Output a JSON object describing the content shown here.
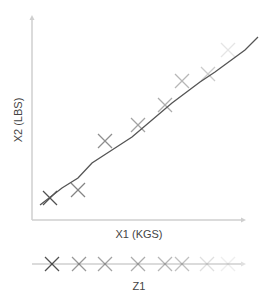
{
  "labels": {
    "y_axis": "X2 (LBS)",
    "x_axis": "X1 (KGS)",
    "z_axis": "Z1"
  },
  "colors": {
    "axis": "#c8c8c8",
    "line": "#555555",
    "label": "#444444"
  },
  "chart_data": {
    "type": "scatter",
    "title": "",
    "xlabel": "X1 (KGS)",
    "ylabel": "X2 (LBS)",
    "grid": false,
    "points": [
      {
        "x": 50,
        "y": 198,
        "opacity": 0.85
      },
      {
        "x": 78,
        "y": 190,
        "opacity": 0.6
      },
      {
        "x": 105,
        "y": 141,
        "opacity": 0.55
      },
      {
        "x": 138,
        "y": 125,
        "opacity": 0.45
      },
      {
        "x": 165,
        "y": 105,
        "opacity": 0.4
      },
      {
        "x": 182,
        "y": 81,
        "opacity": 0.35
      },
      {
        "x": 208,
        "y": 74,
        "opacity": 0.25
      },
      {
        "x": 228,
        "y": 50,
        "opacity": 0.12
      }
    ],
    "fit_line": [
      [
        40,
        205
      ],
      [
        62,
        188
      ],
      [
        78,
        178
      ],
      [
        92,
        163
      ],
      [
        112,
        150
      ],
      [
        132,
        137
      ],
      [
        152,
        120
      ],
      [
        172,
        103
      ],
      [
        200,
        82
      ],
      [
        215,
        72
      ],
      [
        245,
        50
      ],
      [
        258,
        37
      ]
    ],
    "projection": {
      "label": "Z1",
      "points": [
        {
          "x": 52,
          "opacity": 0.85
        },
        {
          "x": 79,
          "opacity": 0.5
        },
        {
          "x": 105,
          "opacity": 0.45
        },
        {
          "x": 138,
          "opacity": 0.4
        },
        {
          "x": 165,
          "opacity": 0.35
        },
        {
          "x": 182,
          "opacity": 0.3
        },
        {
          "x": 207,
          "opacity": 0.15
        },
        {
          "x": 228,
          "opacity": 0.08
        }
      ]
    }
  }
}
